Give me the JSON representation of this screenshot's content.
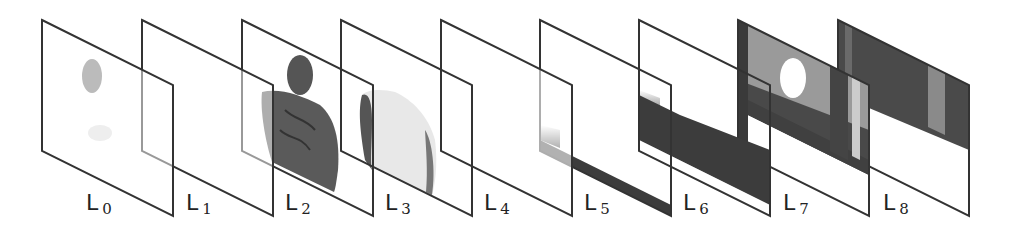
{
  "diagram": {
    "type": "layered-decomposition",
    "layers": [
      {
        "id": "L0",
        "label": "L",
        "sub": "0",
        "content": "faint gray blobs"
      },
      {
        "id": "L1",
        "label": "L",
        "sub": "1",
        "content": "nearly empty"
      },
      {
        "id": "L2",
        "label": "L",
        "sub": "2",
        "content": "dark tattooed human torso"
      },
      {
        "id": "L3",
        "label": "L",
        "sub": "3",
        "content": "light human torso (back view)"
      },
      {
        "id": "L4",
        "label": "L",
        "sub": "4",
        "content": "empty"
      },
      {
        "id": "L5",
        "label": "L",
        "sub": "5",
        "content": "dark floor band at bottom"
      },
      {
        "id": "L6",
        "label": "L",
        "sub": "6",
        "content": "dark diagonal floor band"
      },
      {
        "id": "L7",
        "label": "L",
        "sub": "7",
        "content": "gray wall with pillars, white window"
      },
      {
        "id": "L8",
        "label": "L",
        "sub": "8",
        "content": "dark back wall with pillars"
      }
    ],
    "colors": {
      "frame": "#333333",
      "dark": "#3c3c3c",
      "mid": "#8a8a8a",
      "light": "#d8d8d8"
    }
  }
}
